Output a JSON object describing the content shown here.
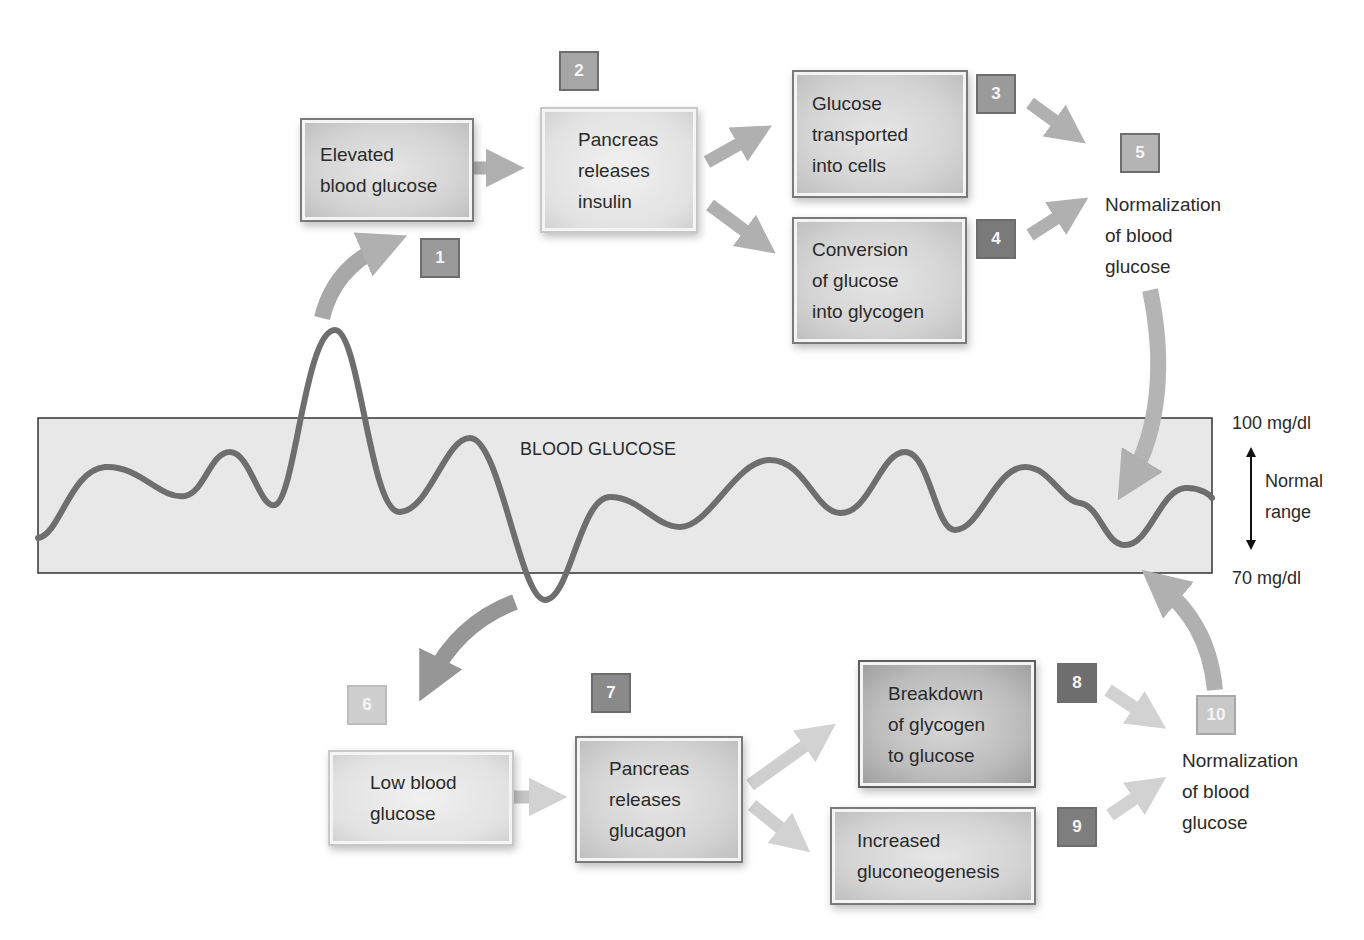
{
  "diagram": {
    "band": {
      "label": "BLOOD GLUCOSE"
    },
    "range": {
      "upper": "100 mg/dl",
      "lower": "70 mg/dl",
      "label_line1": "Normal",
      "label_line2": "range"
    },
    "steps": [
      {
        "num": "1",
        "color": "#9a9a9a"
      },
      {
        "num": "2",
        "color": "#a6a6a6"
      },
      {
        "num": "3",
        "color": "#9a9a9a"
      },
      {
        "num": "4",
        "color": "#7a7a7a"
      },
      {
        "num": "5",
        "color": "#b4b4b4"
      },
      {
        "num": "6",
        "color": "#cfcfcf"
      },
      {
        "num": "7",
        "color": "#8a8a8a"
      },
      {
        "num": "8",
        "color": "#6e6e6e"
      },
      {
        "num": "9",
        "color": "#7e7e7e"
      },
      {
        "num": "10",
        "color": "#c9c9c9"
      }
    ],
    "boxes": {
      "elevated": [
        "Elevated",
        "blood glucose"
      ],
      "insulin": [
        "Pancreas",
        "releases",
        "insulin"
      ],
      "transport": [
        "Glucose",
        "transported",
        "into cells"
      ],
      "glycogen": [
        "Conversion",
        "of glucose",
        "into glycogen"
      ],
      "low": [
        "Low blood",
        "glucose"
      ],
      "glucagon": [
        "Pancreas",
        "releases",
        "glucagon"
      ],
      "breakdown": [
        "Breakdown",
        "of glycogen",
        "to glucose"
      ],
      "gluconeo": [
        "Increased",
        "gluconeogenesis"
      ]
    },
    "normalization_top": [
      "Normalization",
      "of blood",
      "glucose"
    ],
    "normalization_bottom": [
      "Normalization",
      "of blood",
      "glucose"
    ]
  }
}
